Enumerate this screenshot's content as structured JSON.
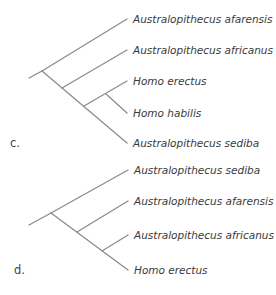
{
  "trees": [
    {
      "label": "c.",
      "taxa": [
        "Australopithecus afarensis",
        "Australopithecus africanus",
        "Homo erectus",
        "Homo habilis",
        "Australopithecus sediba"
      ]
    },
    {
      "label": "d.",
      "taxa": [
        "Australopithecus sediba",
        "Australopithecus afarensis",
        "Australopithecus africanus",
        "Homo erectus"
      ]
    }
  ],
  "colors": {
    "branch": "#8c8c8c",
    "text": "#3a3a3a"
  }
}
